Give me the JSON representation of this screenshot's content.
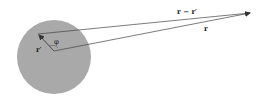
{
  "diagram": {
    "labels": {
      "r_minus_rprime": "r − r′",
      "r": "r",
      "rprime": "r′",
      "phi": "φ"
    },
    "colors": {
      "sphere_fill": "#a9a9a9",
      "line": "#444444",
      "background": "#ffffff"
    },
    "geometry": {
      "sphere_center": [
        54,
        57
      ],
      "sphere_radius": 37,
      "origin": [
        54,
        51
      ],
      "source_point": [
        38,
        34
      ],
      "field_point": [
        252,
        13
      ]
    }
  }
}
